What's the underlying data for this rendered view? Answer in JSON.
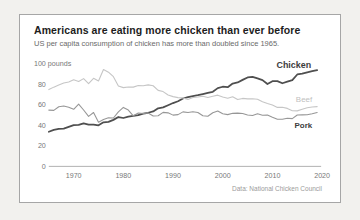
{
  "window": {
    "background": "#f2f1ee",
    "card_background": "#ffffff",
    "card_border": "#a6a6a6"
  },
  "chart_data": {
    "type": "line",
    "title": "Americans are eating more chicken than ever before",
    "subtitle": "US per capita consumption of chicken has more than doubled since 1965.",
    "y_top_label": "100 pounds",
    "ylabel": "pounds",
    "source": "Data: National Chicken Council",
    "ylim": [
      0,
      100
    ],
    "yticks": [
      0,
      20,
      40,
      60,
      80,
      100
    ],
    "xticks": [
      1970,
      1980,
      1990,
      2000,
      2010,
      2020
    ],
    "grid": false,
    "legend_position": "end-of-line-labels",
    "x": [
      1965,
      1966,
      1967,
      1968,
      1969,
      1970,
      1971,
      1972,
      1973,
      1974,
      1975,
      1976,
      1977,
      1978,
      1979,
      1980,
      1981,
      1982,
      1983,
      1984,
      1985,
      1986,
      1987,
      1988,
      1989,
      1990,
      1991,
      1992,
      1993,
      1994,
      1995,
      1996,
      1997,
      1998,
      1999,
      2000,
      2001,
      2002,
      2003,
      2004,
      2005,
      2006,
      2007,
      2008,
      2009,
      2010,
      2011,
      2012,
      2013,
      2014,
      2015,
      2016,
      2017,
      2018,
      2019
    ],
    "series": [
      {
        "name": "Chicken",
        "color": "#4f4f4f",
        "width": 1.8,
        "values": [
          33.7,
          35.5,
          36.4,
          36.7,
          38.4,
          40.1,
          40.3,
          41.8,
          40.5,
          40.7,
          39.9,
          42.8,
          43.3,
          45.2,
          48.0,
          47.0,
          48.4,
          49.0,
          49.9,
          51.3,
          52.1,
          53.4,
          56.4,
          57.4,
          59.4,
          61.5,
          63.3,
          66.0,
          67.2,
          68.3,
          69.1,
          70.2,
          71.3,
          72.5,
          76.1,
          77.4,
          76.9,
          80.5,
          81.5,
          84.0,
          86.4,
          86.9,
          85.5,
          83.8,
          80.0,
          82.8,
          82.9,
          80.8,
          82.3,
          83.8,
          89.3,
          90.1,
          91.4,
          92.5,
          93.5
        ]
      },
      {
        "name": "Beef",
        "color": "#c6c6c6",
        "width": 1.1,
        "values": [
          74.6,
          77.0,
          79.0,
          81.0,
          82.0,
          84.1,
          82.5,
          85.3,
          80.5,
          85.6,
          83.0,
          94.1,
          91.5,
          87.2,
          78.1,
          76.5,
          77.2,
          77.0,
          78.6,
          78.4,
          79.2,
          78.4,
          73.8,
          72.7,
          69.3,
          67.8,
          66.8,
          66.5,
          65.1,
          67.0,
          67.4,
          68.2,
          66.9,
          68.1,
          69.2,
          67.5,
          66.2,
          67.7,
          64.9,
          66.1,
          65.6,
          65.7,
          65.2,
          62.8,
          61.1,
          59.6,
          57.3,
          57.5,
          56.3,
          54.1,
          53.9,
          55.6,
          57.0,
          57.7,
          58.1
        ]
      },
      {
        "name": "Pork",
        "color": "#979797",
        "width": 1.1,
        "values": [
          54.7,
          54.4,
          58.0,
          58.7,
          57.5,
          55.5,
          60.5,
          54.8,
          48.7,
          52.4,
          43.0,
          45.6,
          47.2,
          47.0,
          52.9,
          57.3,
          54.7,
          49.1,
          51.8,
          51.4,
          51.9,
          49.0,
          49.2,
          52.5,
          52.0,
          49.8,
          50.3,
          53.0,
          52.3,
          53.1,
          52.4,
          49.1,
          48.7,
          52.1,
          53.8,
          51.2,
          50.3,
          51.5,
          51.7,
          51.3,
          50.0,
          49.5,
          51.1,
          49.7,
          49.9,
          47.8,
          45.9,
          45.9,
          46.8,
          46.4,
          49.9,
          50.1,
          50.2,
          51.2,
          52.4
        ]
      }
    ],
    "end_labels": [
      {
        "series": "Chicken",
        "x": 293,
        "y": 54,
        "color": "#3d3d3d",
        "weight": "700",
        "size": 9
      },
      {
        "series": "Beef",
        "x": 294,
        "y": 88,
        "color": "#bfbfbf",
        "weight": "400",
        "size": 8
      },
      {
        "series": "Pork",
        "x": 294,
        "y": 114,
        "color": "#3d3d3d",
        "weight": "700",
        "size": 8
      }
    ],
    "style": {
      "axis_color": "#a8a8a8",
      "tick_color": "#787878",
      "source_color": "#9b9b9b"
    },
    "plot": {
      "x0": 29,
      "x1": 304,
      "y0": 153,
      "y1": 49,
      "xmin": 1965,
      "xmax": 2020,
      "ymax": 100
    }
  }
}
